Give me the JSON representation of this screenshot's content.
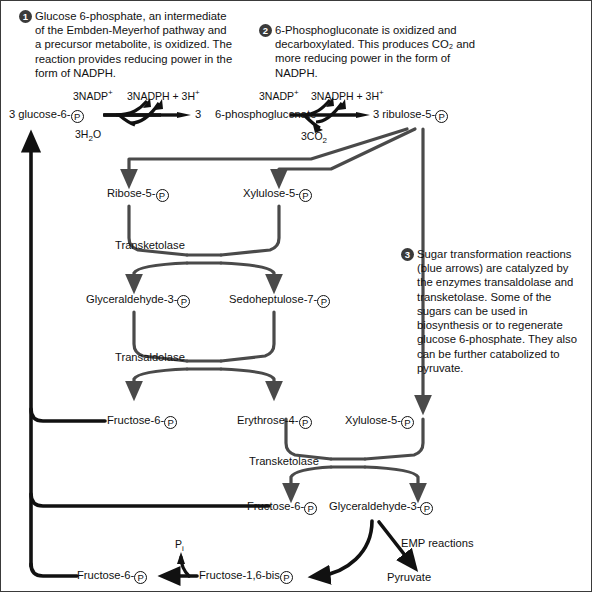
{
  "figure": {
    "colors": {
      "sugar_arrow": "#4a4a4a",
      "black_arrow": "#111111",
      "callout_badge": "#3a3a3a",
      "frame": "#3a3a3a",
      "background": "#ffffff"
    }
  },
  "callouts": [
    {
      "number": "1",
      "lines": [
        "Glucose 6-phosphate,  an intermediate",
        "of the Embden-Meyerhof pathway and",
        "a precursor metabolite,  is oxidized.  The",
        "reaction provides reducing power in the",
        "form of NADPH."
      ]
    },
    {
      "number": "2",
      "lines": [
        "6-Phosphogluconate is oxidized and",
        "decarboxylated.  This produces CO₂ and",
        "more reducing power in the form of",
        "NADPH."
      ]
    },
    {
      "number": "3",
      "lines": [
        "Sugar transformation reactions",
        "(blue arrows) are  catalyzed by",
        "the enzymes transaldolase and",
        "transketolase.  Some of the",
        "sugars can be used in",
        "biosynthesis or to regenerate",
        "glucose 6-phosphate.  They also",
        "can be further catabolized to",
        "pyruvate."
      ]
    }
  ],
  "reaction_top": {
    "substrate_1": "3 glucose-6-",
    "substrate_1_p": "P",
    "cofactor_in_1": "3NADP",
    "cofactor_in_1_sup": "+",
    "cofactor_out_1": "3NADPH + 3H",
    "cofactor_out_1_sup": "+",
    "byproduct_1": "3H",
    "byproduct_1_sub": "2",
    "byproduct_1_tail": "O",
    "product_1_count": "3",
    "product_1": "6-phosphogluconate",
    "cofactor_in_2": "3NADP",
    "cofactor_in_2_sup": "+",
    "cofactor_out_2": "3NADPH + 3H",
    "cofactor_out_2_sup": "+",
    "byproduct_2": "3CO",
    "byproduct_2_sub": "2",
    "product_2": "3 ribulose-5-",
    "product_2_p": "P"
  },
  "metabolites": [
    {
      "id": "ribose5p",
      "text": "Ribose-5-",
      "p": "P"
    },
    {
      "id": "xylulose5p-a",
      "text": "Xylulose-5-",
      "p": "P"
    },
    {
      "id": "gap-1",
      "text": "Glyceraldehyde-3-",
      "p": "P"
    },
    {
      "id": "sedoheptulose7p",
      "text": "Sedoheptulose-7-",
      "p": "P"
    },
    {
      "id": "f6p-1",
      "text": "Fructose-6-",
      "p": "P"
    },
    {
      "id": "erythrose4p",
      "text": "Erythrose-4-",
      "p": "P"
    },
    {
      "id": "xylulose5p-b",
      "text": "Xylulose-5-",
      "p": "P"
    },
    {
      "id": "f6p-2",
      "text": "Fructose-6-",
      "p": "P"
    },
    {
      "id": "gap-2",
      "text": "Glyceraldehyde-3-",
      "p": "P"
    },
    {
      "id": "f6p-3",
      "text": "Fructose-6-",
      "p": "P"
    },
    {
      "id": "fbp",
      "text": "Fructose-1,6-bis",
      "p": "P"
    }
  ],
  "enzymes": [
    {
      "id": "transketolase-1",
      "label": "Transketolase"
    },
    {
      "id": "transaldolase",
      "label": "Transaldolase"
    },
    {
      "id": "transketolase-2",
      "label": "Transketolase"
    }
  ],
  "annotations": {
    "emp_reactions": "EMP reactions",
    "pyruvate": "Pyruvate",
    "pi": "P",
    "pi_sub": "i"
  }
}
